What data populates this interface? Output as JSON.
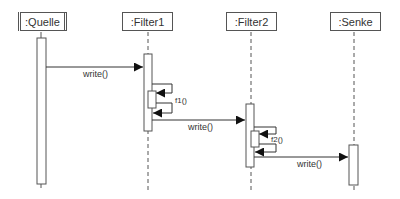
{
  "diagram": {
    "type": "uml-sequence",
    "participants": [
      {
        "id": "quelle",
        "label": ":Quelle",
        "active_object": true
      },
      {
        "id": "filter1",
        "label": ":Filter1"
      },
      {
        "id": "filter2",
        "label": ":Filter2"
      },
      {
        "id": "senke",
        "label": ":Senke"
      }
    ],
    "messages": [
      {
        "from": "quelle",
        "to": "filter1",
        "label": "write()"
      },
      {
        "from": "filter1",
        "to": "filter1",
        "label": "f1()",
        "kind": "self-call"
      },
      {
        "from": "filter1",
        "to": "filter2",
        "label": "write()"
      },
      {
        "from": "filter2",
        "to": "filter2",
        "label": "f2()",
        "kind": "self-call"
      },
      {
        "from": "filter2",
        "to": "senke",
        "label": "write()"
      }
    ]
  },
  "colors": {
    "line": "#444444",
    "text": "#333333",
    "background": "#ffffff"
  }
}
